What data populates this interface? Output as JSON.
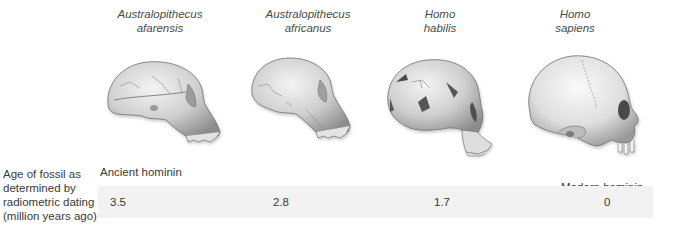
{
  "species": [
    {
      "genus": "Australopithecus",
      "epithet": "afarensis"
    },
    {
      "genus": "Australopithecus",
      "epithet": "africanus"
    },
    {
      "genus": "Homo",
      "epithet": "habilis"
    },
    {
      "genus": "Homo",
      "epithet": "sapiens"
    }
  ],
  "row_label": {
    "line1": "Age of fossil as",
    "line2": "determined by",
    "line3": "radiometric dating",
    "line4": "(million years ago)"
  },
  "timeline": {
    "start_label": "Ancient hominin",
    "end_label": "Modern hominin",
    "ages": [
      "3.5",
      "2.8",
      "1.7",
      "0"
    ]
  },
  "colors": {
    "band": "#f2f2f2",
    "bone_light": "#efefef",
    "bone_dark": "#8a8a8a",
    "text": "#3a3a3a"
  }
}
